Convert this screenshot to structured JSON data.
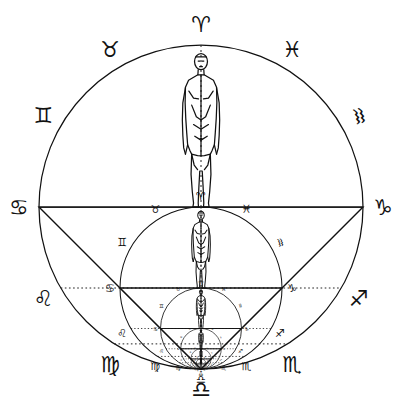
{
  "diagram": {
    "background_color": "#ffffff",
    "line_color": "#111111",
    "dotted_color": "#222222",
    "canvas": {
      "width": 402,
      "height": 418
    }
  },
  "geometry": {
    "main_circle": {
      "cx": 201,
      "cy": 207,
      "r": 162
    },
    "horizontal_axis_label_left": "Cancer",
    "horizontal_axis_label_right": "Capricorn",
    "vertical_axis_label_top": "Aries",
    "vertical_axis_label_bottom": "Libra",
    "recursion_levels": 6,
    "scale_factor": 0.5,
    "nesting_rule": "each child circle is half the radius of its parent and tangent at the Libra (bottom) point"
  },
  "zodiac": {
    "signs": [
      {
        "name": "Aries",
        "glyph": "♈",
        "position": "top",
        "angle_deg": 90,
        "rotation_deg": 0
      },
      {
        "name": "Taurus",
        "glyph": "♉",
        "position": "upper-left",
        "angle_deg": 120,
        "rotation_deg": 0
      },
      {
        "name": "Gemini",
        "glyph": "♊",
        "position": "left-upper",
        "angle_deg": 150,
        "rotation_deg": 0
      },
      {
        "name": "Cancer",
        "glyph": "♋",
        "position": "left",
        "angle_deg": 180,
        "rotation_deg": 0
      },
      {
        "name": "Leo",
        "glyph": "♌",
        "position": "left-lower",
        "angle_deg": 210,
        "rotation_deg": 0
      },
      {
        "name": "Virgo",
        "glyph": "♍",
        "position": "lower-left",
        "angle_deg": 240,
        "rotation_deg": 0
      },
      {
        "name": "Libra",
        "glyph": "♎",
        "position": "bottom",
        "angle_deg": 270,
        "rotation_deg": 0
      },
      {
        "name": "Scorpio",
        "glyph": "♏",
        "position": "lower-right",
        "angle_deg": 300,
        "rotation_deg": 0
      },
      {
        "name": "Sagittarius",
        "glyph": "♐",
        "position": "right-lower",
        "angle_deg": 330,
        "rotation_deg": 0
      },
      {
        "name": "Capricorn",
        "glyph": "♑",
        "position": "right",
        "angle_deg": 0,
        "rotation_deg": 0
      },
      {
        "name": "Aquarius",
        "glyph": "♒",
        "position": "right-upper",
        "angle_deg": 30,
        "rotation_deg": 75
      },
      {
        "name": "Pisces",
        "glyph": "♓",
        "position": "upper-right",
        "angle_deg": 60,
        "rotation_deg": 0
      }
    ]
  },
  "figure": {
    "name": "human-figure",
    "count_visible": 6
  }
}
